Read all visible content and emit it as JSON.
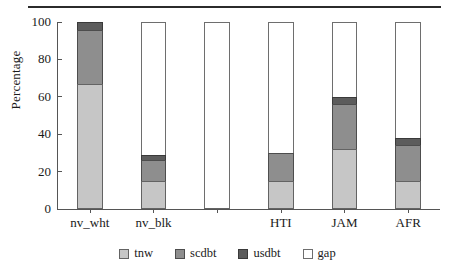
{
  "chart_data": {
    "type": "bar",
    "stacked": true,
    "title": "",
    "xlabel": "",
    "ylabel": "Percentage",
    "ylim": [
      0,
      100
    ],
    "yticks": [
      0,
      20,
      40,
      60,
      80,
      100
    ],
    "grid": false,
    "legend_position": "bottom-center",
    "categories": [
      "nv_wht",
      "nv_blk",
      "",
      "HTI",
      "JAM",
      "AFR"
    ],
    "series": [
      {
        "name": "tnw",
        "color": "#c6c6c6",
        "values": [
          67,
          15,
          0,
          15,
          32,
          15
        ]
      },
      {
        "name": "scdbt",
        "color": "#8e8e8e",
        "values": [
          29,
          11,
          0,
          15,
          24,
          19
        ]
      },
      {
        "name": "usdbt",
        "color": "#5c5c5c",
        "values": [
          4,
          3,
          0,
          0,
          4,
          4
        ]
      },
      {
        "name": "gap",
        "color": "#ffffff",
        "values": [
          0,
          71,
          100,
          70,
          40,
          62
        ]
      }
    ],
    "legend": [
      {
        "label": "tnw",
        "color": "#c6c6c6"
      },
      {
        "label": "scdbt",
        "color": "#8e8e8e"
      },
      {
        "label": "usdbt",
        "color": "#5c5c5c"
      },
      {
        "label": "gap",
        "color": "#ffffff"
      }
    ],
    "bars": [
      {
        "label": "nv_wht",
        "tnw": 67,
        "scdbt": 29,
        "usdbt": 4,
        "gap": 0
      },
      {
        "label": "nv_blk",
        "tnw": 15,
        "scdbt": 11,
        "usdbt": 3,
        "gap": 71
      },
      {
        "label": "",
        "tnw": 0,
        "scdbt": 0,
        "usdbt": 0,
        "gap": 100
      },
      {
        "label": "HTI",
        "tnw": 15,
        "scdbt": 15,
        "usdbt": 0,
        "gap": 70
      },
      {
        "label": "JAM",
        "tnw": 32,
        "scdbt": 24,
        "usdbt": 4,
        "gap": 40
      },
      {
        "label": "AFR",
        "tnw": 15,
        "scdbt": 19,
        "usdbt": 4,
        "gap": 62
      }
    ]
  }
}
